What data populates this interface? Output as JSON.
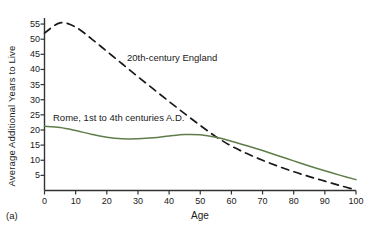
{
  "panel": {
    "caption": "(a)"
  },
  "chart_data": {
    "type": "line",
    "title": "",
    "xlabel": "Age",
    "ylabel": "Average Additional Years to Live",
    "xlim": [
      0,
      100
    ],
    "ylim": [
      0,
      57
    ],
    "grid": false,
    "legend_position": "inline-annotation",
    "xticks": [
      0,
      10,
      20,
      30,
      40,
      50,
      60,
      70,
      80,
      90,
      100
    ],
    "yticks": [
      5,
      10,
      15,
      20,
      25,
      30,
      35,
      40,
      45,
      50,
      55
    ],
    "x": [
      0,
      5,
      10,
      15,
      20,
      25,
      30,
      35,
      40,
      45,
      50,
      55,
      60,
      65,
      70,
      75,
      80,
      85,
      90,
      95,
      100
    ],
    "series": [
      {
        "name": "20th-century England",
        "style": "dashed",
        "color": "#1a1a1a",
        "annotation": "20th-century England",
        "values": [
          52.0,
          55.4,
          54.0,
          50.2,
          46.0,
          41.8,
          37.6,
          33.5,
          29.4,
          25.4,
          21.5,
          17.8,
          14.7,
          12.2,
          10.0,
          8.0,
          6.2,
          4.6,
          3.1,
          1.6,
          0.2
        ]
      },
      {
        "name": "Rome, 1st to 4th centuries A.D.",
        "style": "solid",
        "color": "#5f7d4a",
        "annotation": "Rome, 1st to 4th centuries A.D.",
        "values": [
          21.2,
          20.8,
          19.8,
          18.6,
          17.6,
          17.1,
          17.1,
          17.4,
          18.0,
          18.5,
          18.4,
          17.6,
          16.3,
          14.8,
          13.2,
          11.5,
          9.8,
          8.1,
          6.5,
          5.0,
          3.6
        ]
      }
    ],
    "crossover": {
      "age": 55,
      "value": 17.7
    }
  }
}
